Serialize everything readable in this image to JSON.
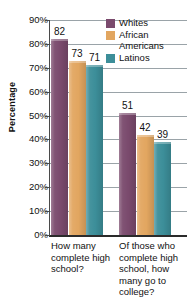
{
  "chart_data": {
    "type": "bar",
    "title": "",
    "xlabel": "",
    "ylabel": "Percentage",
    "ylim": [
      0,
      90
    ],
    "ytick_labels": [
      "90%",
      "80%",
      "70%",
      "60%",
      "50%",
      "40%",
      "30%",
      "20%",
      "10%",
      "0%"
    ],
    "ytick_values": [
      90,
      80,
      70,
      60,
      50,
      40,
      30,
      20,
      10,
      0
    ],
    "grid": true,
    "legend_position": "top-right",
    "categories": [
      "How many complete high school?",
      "Of those who complete high school, how many go to college?"
    ],
    "series": [
      {
        "name": "Whites",
        "color": "#7a4a6d",
        "values": [
          82,
          51
        ]
      },
      {
        "name": "African Americans",
        "color": "#e2a660",
        "values": [
          73,
          42
        ]
      },
      {
        "name": "Latinos",
        "color": "#3c8e99",
        "values": [
          71,
          39
        ]
      }
    ]
  },
  "legend": {
    "items": [
      {
        "label": "Whites",
        "color": "#7a4a6d"
      },
      {
        "label": "African Americans",
        "color": "#e2a660"
      },
      {
        "label": "Latinos",
        "color": "#3c8e99"
      }
    ]
  },
  "axis": {
    "y_title": "Percentage"
  },
  "category_labels": [
    "How many complete high school?",
    "Of those who complete high school, how many go to college?"
  ],
  "bar_value_labels": [
    "82",
    "73",
    "71",
    "51",
    "42",
    "39"
  ]
}
